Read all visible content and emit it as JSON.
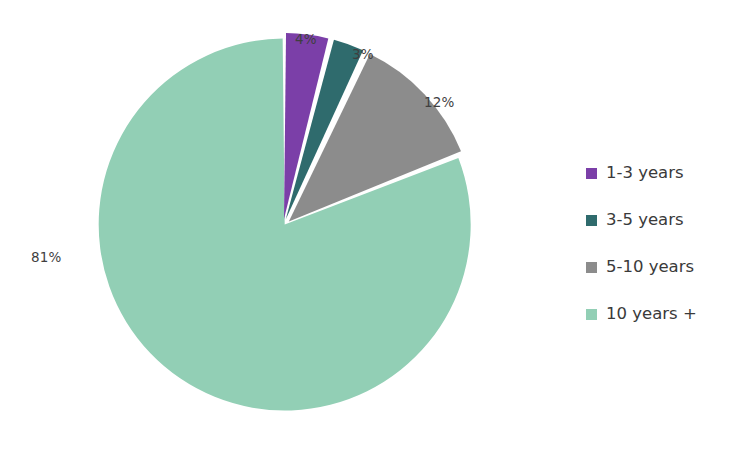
{
  "chart_data": {
    "type": "pie",
    "title": "",
    "categories": [
      "1-3 years",
      "3-5 years",
      "5-10 years",
      "10 years +"
    ],
    "values": [
      4,
      3,
      12,
      81
    ],
    "value_labels": [
      "4%",
      "3%",
      "12%",
      "81%"
    ],
    "unit": "percent",
    "colors": [
      "#7b3fa8",
      "#2f6b6d",
      "#8c8c8c",
      "#92cfb5"
    ],
    "legend_position": "right",
    "grid": false,
    "exploded": true,
    "start_angle_deg": 0,
    "slice_gap": "white separator between slices",
    "xlabel": "",
    "ylabel": ""
  },
  "legend": {
    "items": [
      {
        "label": "1-3 years",
        "color": "#7b3fa8"
      },
      {
        "label": "3-5 years",
        "color": "#2f6b6d"
      },
      {
        "label": "5-10 years",
        "color": "#8c8c8c"
      },
      {
        "label": "10 years +",
        "color": "#92cfb5"
      }
    ]
  },
  "labels": {
    "p0": "4%",
    "p1": "3%",
    "p2": "12%",
    "p3": "81%"
  },
  "theme": {
    "background": "#ffffff",
    "label_color": "#3f3f3f",
    "legend_text_color": "#3a3a3a"
  }
}
